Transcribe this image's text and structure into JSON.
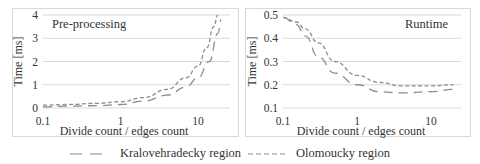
{
  "chart_data": [
    {
      "type": "line",
      "title": "Pre-processing",
      "xlabel": "Divide count / edges count",
      "ylabel": "Time [ms]",
      "xscale": "log",
      "xlim": [
        0.1,
        20
      ],
      "ylim": [
        0,
        4
      ],
      "xticks": [
        "0.1",
        "1",
        "10"
      ],
      "yticks": [
        "0",
        "1",
        "2",
        "3",
        "4"
      ],
      "grid": "horizontal",
      "series": [
        {
          "name": "Kralovehradecky region",
          "style": "long-dash",
          "x": [
            0.1,
            0.2,
            0.5,
            1,
            2,
            4,
            7,
            10,
            14,
            18,
            20
          ],
          "y": [
            0.05,
            0.08,
            0.1,
            0.15,
            0.3,
            0.55,
            0.9,
            1.3,
            2.0,
            3.2,
            3.8
          ]
        },
        {
          "name": "Olomoucky region",
          "style": "short-dash",
          "x": [
            0.1,
            0.2,
            0.5,
            1,
            2,
            4,
            7,
            10,
            13,
            16,
            18
          ],
          "y": [
            0.12,
            0.15,
            0.2,
            0.27,
            0.45,
            0.8,
            1.3,
            1.8,
            2.6,
            3.5,
            4.0
          ]
        }
      ]
    },
    {
      "type": "line",
      "title": "Runtime",
      "xlabel": "Divide count / edges count",
      "ylabel": "Time [ms]",
      "xscale": "log",
      "xlim": [
        0.1,
        20
      ],
      "ylim": [
        0.1,
        0.5
      ],
      "xticks": [
        "0.1",
        "1",
        "10"
      ],
      "yticks": [
        "0.1",
        "0.2",
        "0.3",
        "0.4",
        "0.5"
      ],
      "grid": "horizontal",
      "series": [
        {
          "name": "Kralovehradecky region",
          "style": "long-dash",
          "x": [
            0.1,
            0.15,
            0.2,
            0.3,
            0.5,
            1,
            2,
            4,
            10,
            20
          ],
          "y": [
            0.49,
            0.46,
            0.41,
            0.32,
            0.25,
            0.2,
            0.17,
            0.165,
            0.17,
            0.18
          ]
        },
        {
          "name": "Olomoucky region",
          "style": "short-dash",
          "x": [
            0.1,
            0.15,
            0.2,
            0.3,
            0.5,
            1,
            2,
            4,
            10,
            20
          ],
          "y": [
            0.49,
            0.47,
            0.44,
            0.38,
            0.3,
            0.24,
            0.21,
            0.195,
            0.195,
            0.2
          ]
        }
      ]
    }
  ],
  "panels": {
    "left": {
      "title": "Pre-processing",
      "ylabel": "Time [ms]",
      "xlabel": "Divide count / edges count"
    },
    "right": {
      "title": "Runtime",
      "ylabel": "Time [ms]",
      "xlabel": "Divide count / edges count"
    }
  },
  "legend": {
    "items": [
      {
        "label": "Kralovehradecky region",
        "style": "long-dash"
      },
      {
        "label": "Olomoucky region",
        "style": "short-dash"
      }
    ]
  },
  "colors": {
    "line": "#8c8c8c",
    "grid": "#d9d9d9",
    "border": "#d9d9d9",
    "text": "#333333"
  }
}
